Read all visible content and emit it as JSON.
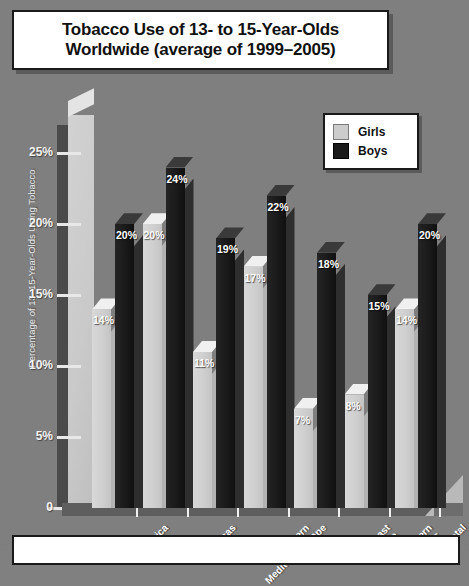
{
  "title": {
    "text": "Tobacco Use of 13- to 15-Year-Olds\nWorldwide (average of 1999–2005)"
  },
  "legend": {
    "items": [
      {
        "label": "Girls",
        "color": "#cccccc"
      },
      {
        "label": "Boys",
        "color": "#1a1a1a"
      }
    ]
  },
  "axis": {
    "y_title": "Percentage of 13–15-Year-Olds Using Tobacco",
    "y_ticks": [
      "25%",
      "20%",
      "15%",
      "10%",
      "5%",
      "0"
    ]
  },
  "chart_data": {
    "type": "bar",
    "title": "Tobacco Use of 13- to 15-Year-Olds Worldwide (average of 1999–2005)",
    "xlabel": "",
    "ylabel": "Percentage of 13–15-Year-Olds Using Tobacco",
    "ylim": [
      0,
      27
    ],
    "ytick_values": [
      0,
      5,
      10,
      15,
      20,
      25
    ],
    "ytick_labels": [
      "0",
      "5%",
      "10%",
      "15%",
      "20%",
      "25%"
    ],
    "grid": false,
    "legend_position": "top-right",
    "categories": [
      "Africa",
      "Americas",
      "Eastern\nMediterranean",
      "Europe",
      "Southeast\nAsia",
      "Western\nPacific",
      "Total"
    ],
    "series": [
      {
        "name": "Girls",
        "color": "#cccccc",
        "values": [
          14,
          20,
          11,
          17,
          7,
          8,
          14
        ],
        "labels": [
          "14%",
          "20%",
          "11%",
          "17%",
          "7%",
          "8%",
          "14%"
        ]
      },
      {
        "name": "Boys",
        "color": "#1a1a1a",
        "values": [
          20,
          24,
          19,
          22,
          18,
          15,
          20
        ],
        "labels": [
          "20%",
          "24%",
          "19%",
          "22%",
          "18%",
          "15%",
          "20%"
        ]
      }
    ]
  },
  "caption": {
    "text": ""
  }
}
